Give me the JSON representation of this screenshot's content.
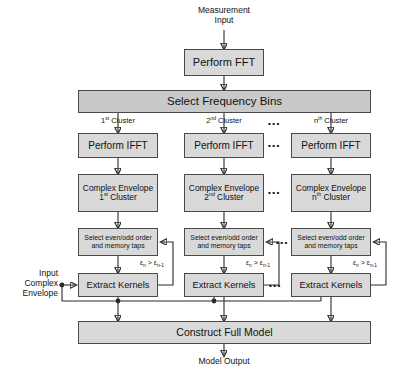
{
  "diagram": {
    "colors": {
      "box_light": "#d9d9d9",
      "box_mid": "#c9c9c9",
      "stroke": "#2b2b2b",
      "border": "#4a4a4a"
    },
    "input_label": "Measurement\nInput",
    "input_label_line1": "Measurement",
    "input_label_line2": "Input",
    "perform_fft": "Perform FFT",
    "select_frequency_bins": "Select Frequency Bins",
    "cluster_labels": [
      {
        "ordinal_num": "1",
        "ordinal_suffix": "st",
        "word": " Cluster"
      },
      {
        "ordinal_num": "2",
        "ordinal_suffix": "nd",
        "word": " Cluster"
      },
      {
        "ordinal_num": "n",
        "ordinal_suffix": "th",
        "word": " Cluster"
      }
    ],
    "perform_ifft": "Perform IFFT",
    "complex_envelope_line1": "Complex Envelope",
    "complex_envelope_ordinals": [
      {
        "num": "1",
        "suffix": "st",
        "word": " Cluster"
      },
      {
        "num": "2",
        "suffix": "nd",
        "word": " Cluster"
      },
      {
        "num": "n",
        "suffix": "th",
        "word": " Cluster"
      }
    ],
    "select_order_line1": "Select even/odd order",
    "select_order_line2": "and memory taps",
    "feedback_condition": {
      "eps": "ε",
      "sub_n": "n",
      "op": " > ",
      "sub_n1": "n-1"
    },
    "extract_kernels": "Extract Kernels",
    "input_complex_envelope": {
      "line1": "Input",
      "line2": "Complex",
      "line3": "Envelope"
    },
    "construct_full_model": "Construct Full Model",
    "model_output": "Model Output",
    "ellipsis": "•••"
  }
}
